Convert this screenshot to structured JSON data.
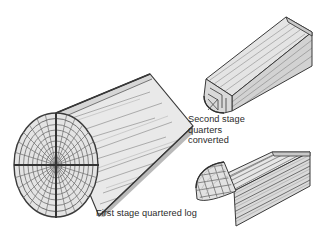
{
  "figure": {
    "name": "log-conversion-stages-diagram",
    "background_color": "#ffffff",
    "width": 322,
    "height": 245
  },
  "captions": {
    "first_stage": "First stage quartered log",
    "second_stage": "Second stage\nquarters\nconverted",
    "text_color": "#2b2b2b"
  },
  "colors": {
    "outline": "#3a3a3a",
    "outline_dark": "#262626",
    "face_light": "#ececec",
    "face_mid": "#dcdcdc",
    "face_dark": "#c9c9c9",
    "face_endgrain": "#e4e4e4",
    "grain_line": "#8a8a8a",
    "grain_line_soft": "#a8a8a8",
    "ring_line": "#6f6f6f",
    "cut_line": "#333333"
  },
  "parts": {
    "quartered_log": {
      "label": "first-stage-quartered-log",
      "description": "large cylindrical log lying diagonally, end grain facing lower-left, quartered by vertical and horizontal saw cuts",
      "growth_rings": 8,
      "radial_rays": 24,
      "quarter_cuts": 2
    },
    "converted_quarter": {
      "label": "second-stage-quarter-converted",
      "description": "quarter section beam, stepped rebate profile on near end face, bark edge at lower left",
      "sawn_faces": 3
    },
    "battens_quarter": {
      "label": "quarter-sawn-into-battens",
      "description": "quarter log sawn into grid of small square battens, end grain squares visible on cut face",
      "batten_columns": 7,
      "batten_rows": 6
    }
  }
}
